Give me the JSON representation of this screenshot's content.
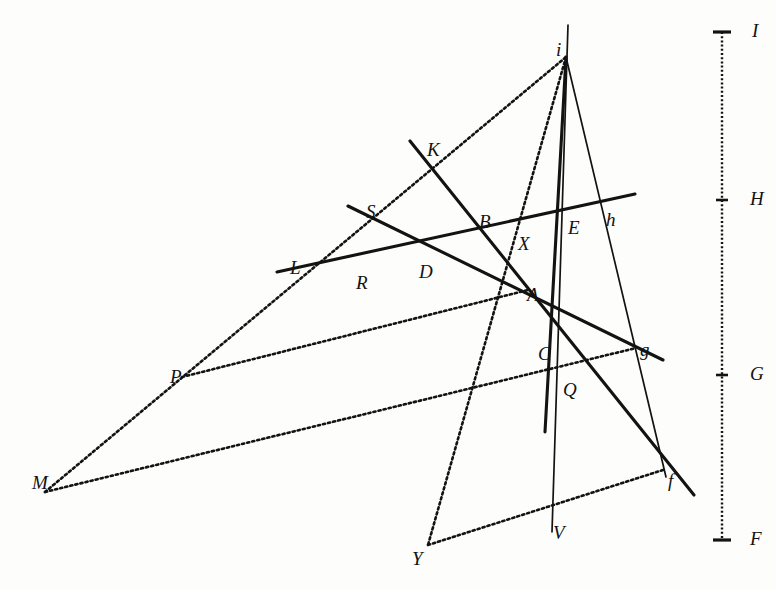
{
  "figure": {
    "background_color": "#fdfdfb",
    "ink_color": "#131313",
    "width": 776,
    "height": 589
  },
  "scale": {
    "name": "vertical-graduated-scale",
    "x": 722,
    "top_y": 32,
    "bottom_y": 540,
    "ticks": [
      {
        "label": "I",
        "y": 32,
        "major": true
      },
      {
        "label": "H",
        "y": 200,
        "major": true
      },
      {
        "label": "G",
        "y": 375,
        "major": true
      },
      {
        "label": "F",
        "y": 540,
        "major": true
      }
    ]
  },
  "points": [
    {
      "id": "I",
      "label": "I",
      "x": 752,
      "y": 32,
      "kind": "scale-mark"
    },
    {
      "id": "H",
      "label": "H",
      "x": 750,
      "y": 200,
      "kind": "scale-mark"
    },
    {
      "id": "G",
      "label": "G",
      "x": 750,
      "y": 375,
      "kind": "scale-mark"
    },
    {
      "id": "F",
      "label": "F",
      "x": 750,
      "y": 540,
      "kind": "scale-mark"
    },
    {
      "id": "i",
      "label": "i",
      "x": 556,
      "y": 40,
      "kind": "vertex"
    },
    {
      "id": "K",
      "label": "K",
      "x": 427,
      "y": 140,
      "kind": "vertex"
    },
    {
      "id": "S",
      "label": "S",
      "x": 366,
      "y": 202,
      "kind": "vertex"
    },
    {
      "id": "B",
      "label": "B",
      "x": 479,
      "y": 212,
      "kind": "intersection"
    },
    {
      "id": "E",
      "label": "E",
      "x": 568,
      "y": 218,
      "kind": "intersection"
    },
    {
      "id": "h",
      "label": "h",
      "x": 606,
      "y": 210,
      "kind": "vertex"
    },
    {
      "id": "X",
      "label": "X",
      "x": 518,
      "y": 234,
      "kind": "intersection"
    },
    {
      "id": "L",
      "label": "L",
      "x": 290,
      "y": 258,
      "kind": "vertex"
    },
    {
      "id": "R",
      "label": "R",
      "x": 356,
      "y": 273,
      "kind": "tick"
    },
    {
      "id": "D",
      "label": "D",
      "x": 419,
      "y": 262,
      "kind": "intersection"
    },
    {
      "id": "A",
      "label": "A",
      "x": 527,
      "y": 285,
      "kind": "intersection"
    },
    {
      "id": "C",
      "label": "C",
      "x": 538,
      "y": 344,
      "kind": "intersection"
    },
    {
      "id": "g",
      "label": "g",
      "x": 640,
      "y": 340,
      "kind": "intersection"
    },
    {
      "id": "P",
      "label": "P",
      "x": 170,
      "y": 367,
      "kind": "vertex"
    },
    {
      "id": "Q",
      "label": "Q",
      "x": 563,
      "y": 380,
      "kind": "intersection"
    },
    {
      "id": "M",
      "label": "M",
      "x": 32,
      "y": 473,
      "kind": "vertex"
    },
    {
      "id": "f",
      "label": "f",
      "x": 668,
      "y": 471,
      "kind": "intersection"
    },
    {
      "id": "V",
      "label": "V",
      "x": 553,
      "y": 523,
      "kind": "intersection"
    },
    {
      "id": "Y",
      "label": "Y",
      "x": 412,
      "y": 549,
      "kind": "vertex"
    }
  ],
  "lines": [
    {
      "name": "line-L-R-h",
      "style": "solid-thick",
      "path": "M277,272 L635,194"
    },
    {
      "name": "line-S-D-g",
      "style": "solid-thick",
      "path": "M348,206 L663,360"
    },
    {
      "name": "line-K-B-A-f",
      "style": "solid-thick",
      "path": "M410,141 L694,495"
    },
    {
      "name": "line-i-E-V",
      "style": "solid-thin",
      "path": "M568,25 L552,532"
    },
    {
      "name": "line-i-g-f",
      "style": "solid-thin",
      "path": "M566,57 L666,477"
    },
    {
      "name": "line-i-C-Y",
      "style": "solid-thick",
      "path": "M566,57 L545,432"
    },
    {
      "name": "dotted-M-L-K-i",
      "style": "dotted",
      "path": "M45,492 L566,57"
    },
    {
      "name": "dotted-i-X-A-Y",
      "style": "dotted",
      "path": "M566,57 L428,545"
    },
    {
      "name": "dotted-P-A",
      "style": "dotted",
      "path": "M182,377 L528,290"
    },
    {
      "name": "dotted-M-Q-g",
      "style": "dotted",
      "path": "M45,492 L636,348"
    },
    {
      "name": "dotted-Y-V-f",
      "style": "dotted",
      "path": "M428,545 L663,470"
    }
  ]
}
